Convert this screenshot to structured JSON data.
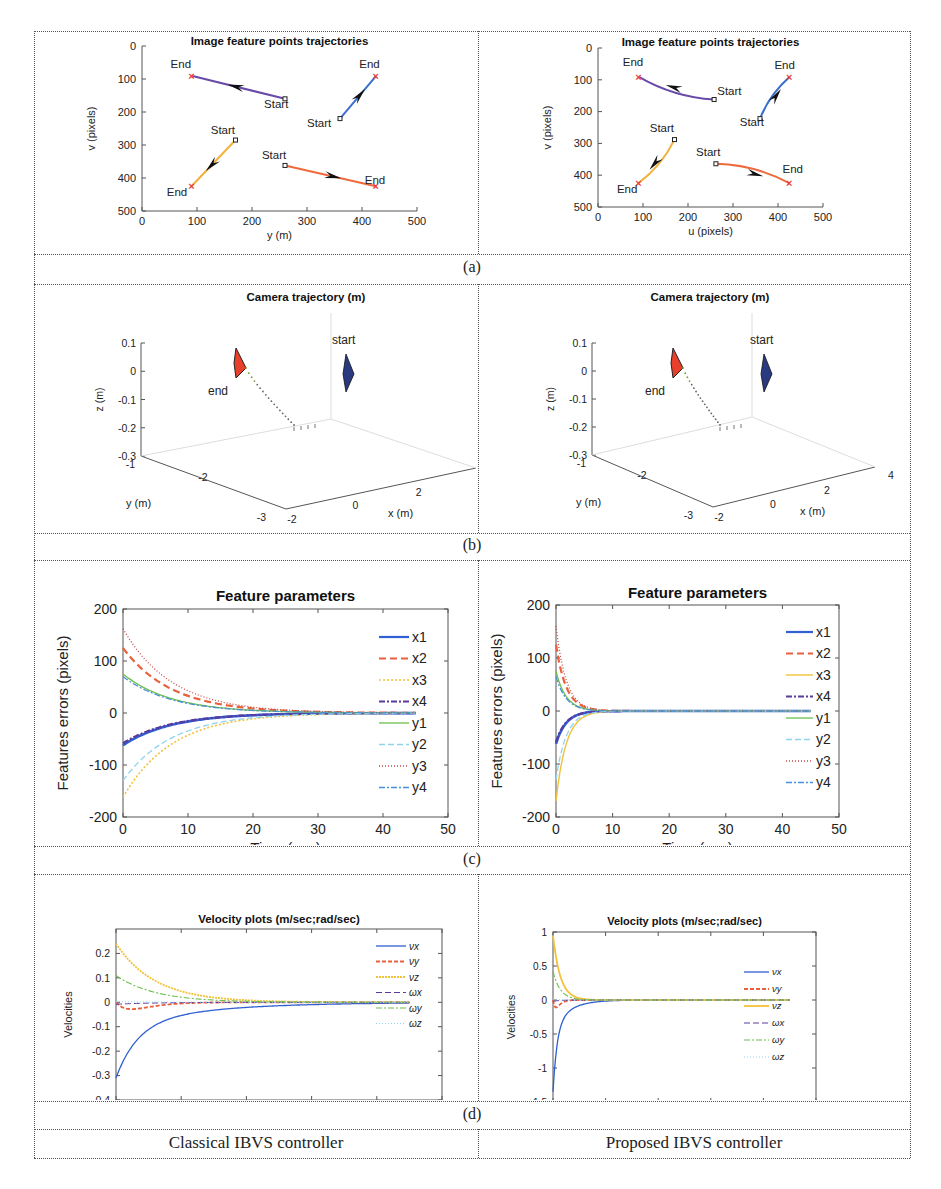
{
  "figure": {
    "rows": [
      {
        "label": "(a)"
      },
      {
        "label": "(b)"
      },
      {
        "label": "(c)"
      },
      {
        "label": "(d)"
      }
    ],
    "footer": {
      "left": "Classical IBVS controller",
      "right": "Proposed IBVS controller"
    }
  },
  "colors": {
    "x1": "#2f5fd0",
    "x2": "#e8603c",
    "x3": "#f2c23a",
    "x4": "#5b3a9e",
    "y1": "#6cc04a",
    "y2": "#8fd3f0",
    "y3": "#c84a4a",
    "y4": "#4a90d9",
    "traj_purple": "#6a4aa8",
    "traj_blue": "#3a6fd0",
    "traj_orange": "#f2b23a",
    "traj_red": "#ee6a3c",
    "end_marker": "#e8403a",
    "cam_end": "#e8402a",
    "cam_start": "#2a3a80"
  },
  "chart_data": [
    {
      "id": "a-left",
      "type": "scatter",
      "title": "Image feature points trajectories",
      "xlabel": "y (m)",
      "ylabel": "v (pixels)",
      "xlim": [
        0,
        500
      ],
      "ylim": [
        500,
        0
      ],
      "xticks": [
        0,
        100,
        200,
        300,
        400,
        500
      ],
      "yticks": [
        0,
        100,
        200,
        300,
        400,
        500
      ],
      "series": [
        {
          "name": "p1",
          "color": "traj_purple",
          "start": [
            260,
            160
          ],
          "end": [
            90,
            90
          ],
          "curve": 0
        },
        {
          "name": "p2",
          "color": "traj_blue",
          "start": [
            360,
            220
          ],
          "end": [
            425,
            92
          ],
          "curve": 0
        },
        {
          "name": "p3",
          "color": "traj_orange",
          "start": [
            170,
            285
          ],
          "end": [
            90,
            425
          ],
          "curve": 0
        },
        {
          "name": "p4",
          "color": "traj_red",
          "start": [
            260,
            362
          ],
          "end": [
            425,
            425
          ],
          "curve": 0
        }
      ],
      "annotations": [
        {
          "text": "End",
          "x": 52,
          "y": 66
        },
        {
          "text": "Start",
          "x": 222,
          "y": 187
        },
        {
          "text": "End",
          "x": 395,
          "y": 66
        },
        {
          "text": "Start",
          "x": 300,
          "y": 246
        },
        {
          "text": "Start",
          "x": 125,
          "y": 268
        },
        {
          "text": "End",
          "x": 45,
          "y": 455
        },
        {
          "text": "Start",
          "x": 218,
          "y": 342
        },
        {
          "text": "End",
          "x": 405,
          "y": 418
        }
      ]
    },
    {
      "id": "a-right",
      "type": "scatter",
      "title": "Image feature points trajectories",
      "xlabel": "u (pixels)",
      "ylabel": "v (pixels)",
      "xlim": [
        0,
        500
      ],
      "ylim": [
        500,
        0
      ],
      "xticks": [
        0,
        100,
        200,
        300,
        400,
        500
      ],
      "yticks": [
        0,
        100,
        200,
        300,
        400,
        500
      ],
      "series": [
        {
          "name": "p1",
          "color": "traj_purple",
          "start": [
            258,
            162
          ],
          "end": [
            90,
            90
          ],
          "curve": 1
        },
        {
          "name": "p2",
          "color": "traj_blue",
          "start": [
            360,
            222
          ],
          "end": [
            425,
            92
          ],
          "curve": 1
        },
        {
          "name": "p3",
          "color": "traj_orange",
          "start": [
            170,
            288
          ],
          "end": [
            90,
            425
          ],
          "curve": 1
        },
        {
          "name": "p4",
          "color": "traj_red",
          "start": [
            262,
            364
          ],
          "end": [
            425,
            425
          ],
          "curve": 1
        }
      ],
      "annotations": [
        {
          "text": "End",
          "x": 55,
          "y": 58
        },
        {
          "text": "Start",
          "x": 265,
          "y": 148
        },
        {
          "text": "End",
          "x": 392,
          "y": 66
        },
        {
          "text": "Start",
          "x": 315,
          "y": 245
        },
        {
          "text": "Start",
          "x": 115,
          "y": 265
        },
        {
          "text": "End",
          "x": 42,
          "y": 455
        },
        {
          "text": "Start",
          "x": 218,
          "y": 340
        },
        {
          "text": "End",
          "x": 410,
          "y": 393
        }
      ]
    },
    {
      "id": "b-left",
      "type": "line3d",
      "title": "Camera trajectory (m)",
      "xlabel": "x (m)",
      "ylabel": "y (m)",
      "zlabel": "z (m)",
      "zticks": [
        0.1,
        0,
        -0.1,
        -0.2,
        -0.3
      ],
      "yticks": [
        -1,
        -2,
        -3
      ],
      "xticks": [
        -2,
        0,
        2,
        4
      ],
      "labels": {
        "start": "start",
        "end": "end"
      }
    },
    {
      "id": "b-right",
      "type": "line3d",
      "title": "Camera trajectory (m)",
      "xlabel": "x (m)",
      "ylabel": "y (m)",
      "zlabel": "z (m)",
      "zticks": [
        0.1,
        0,
        -0.1,
        -0.2,
        -0.3
      ],
      "yticks": [
        -1,
        -2,
        -3
      ],
      "xticks": [
        -2,
        0,
        2,
        4
      ],
      "labels": {
        "start": "start",
        "end": "end"
      }
    },
    {
      "id": "c-left",
      "type": "line",
      "title": "Feature parameters",
      "xlabel": "Time (sec)",
      "ylabel": "Features errors (pixels)",
      "xlim": [
        0,
        50
      ],
      "ylim": [
        -200,
        200
      ],
      "xticks": [
        0,
        10,
        20,
        30,
        40,
        50
      ],
      "yticks": [
        200,
        100,
        0,
        -100,
        -200
      ],
      "t_end": 45,
      "tau": 7.5,
      "series": [
        {
          "name": "x1",
          "y0": -62,
          "color": "x1",
          "dash": "",
          "width": 2.6
        },
        {
          "name": "x2",
          "y0": 125,
          "color": "x2",
          "dash": "7,4",
          "width": 2.2
        },
        {
          "name": "x3",
          "y0": -162,
          "color": "x3",
          "dash": "2,2",
          "width": 1.6
        },
        {
          "name": "x4",
          "y0": -58,
          "color": "x4",
          "dash": "6,2,2,2",
          "width": 2.2
        },
        {
          "name": "y1",
          "y0": 75,
          "color": "y1",
          "dash": "",
          "width": 1.3
        },
        {
          "name": "y2",
          "y0": -130,
          "color": "y2",
          "dash": "6,3",
          "width": 1.3
        },
        {
          "name": "y3",
          "y0": 162,
          "color": "y3",
          "dash": "1,2",
          "width": 1.3
        },
        {
          "name": "y4",
          "y0": 70,
          "color": "y4",
          "dash": "6,2,2,2",
          "width": 1.3
        }
      ],
      "legend": {
        "position": "right-inside"
      }
    },
    {
      "id": "c-right",
      "type": "line",
      "title": "Feature parameters",
      "xlabel": "Time (sec)",
      "ylabel": "Features errors (pixels)",
      "xlim": [
        0,
        50
      ],
      "ylim": [
        -200,
        200
      ],
      "xticks": [
        0,
        10,
        20,
        30,
        40,
        50
      ],
      "yticks": [
        200,
        100,
        0,
        -100,
        -200
      ],
      "t_end": 45,
      "tau": 1.8,
      "series": [
        {
          "name": "x1",
          "y0": -62,
          "color": "x1",
          "dash": "",
          "width": 2.6
        },
        {
          "name": "x2",
          "y0": 125,
          "color": "x2",
          "dash": "7,4",
          "width": 2.2
        },
        {
          "name": "x3",
          "y0": -170,
          "color": "x3",
          "dash": "",
          "width": 1.4
        },
        {
          "name": "x4",
          "y0": -58,
          "color": "x4",
          "dash": "6,2,2,2",
          "width": 2.2
        },
        {
          "name": "y1",
          "y0": 75,
          "color": "y1",
          "dash": "",
          "width": 1.3
        },
        {
          "name": "y2",
          "y0": -130,
          "color": "y2",
          "dash": "6,3",
          "width": 1.3
        },
        {
          "name": "y3",
          "y0": 160,
          "color": "y3",
          "dash": "1,2",
          "width": 1.3
        },
        {
          "name": "y4",
          "y0": 65,
          "color": "y4",
          "dash": "6,2,2,2",
          "width": 1.3
        }
      ],
      "legend": {
        "position": "right-inside"
      }
    },
    {
      "id": "d-left",
      "type": "line",
      "title": "Velocity plots (m/sec;rad/sec)",
      "xlabel": "Time (sec)",
      "ylabel": "Velocities",
      "xlim": [
        0,
        50
      ],
      "ylim": [
        -0.4,
        0.3
      ],
      "xticks": [
        0,
        10,
        20,
        30,
        40,
        50
      ],
      "yticks": [
        0.2,
        0.1,
        0,
        -0.1,
        -0.2,
        -0.3,
        -0.4
      ],
      "t_end": 45,
      "tau": 6,
      "series": [
        {
          "name": "νx",
          "y0": -0.31,
          "color": "x1",
          "dash": "",
          "width": 1.3,
          "shape": "fast"
        },
        {
          "name": "νy",
          "y0": 0,
          "color": "x2",
          "dash": "4,2",
          "width": 1.8,
          "shape": "dip",
          "dip": -0.028
        },
        {
          "name": "νz",
          "y0": 0.24,
          "color": "x3",
          "dash": "2,1",
          "width": 1.8,
          "shape": "exp"
        },
        {
          "name": "ωx",
          "y0": -0.008,
          "color": "x4",
          "dash": "6,3",
          "width": 1,
          "shape": "exp"
        },
        {
          "name": "ωy",
          "y0": 0.11,
          "color": "y1",
          "dash": "6,2,2,2",
          "width": 1.1,
          "shape": "exp"
        },
        {
          "name": "ωz",
          "y0": 0.003,
          "color": "y2",
          "dash": "1,2",
          "width": 1,
          "shape": "exp"
        }
      ],
      "legend": {
        "position": "right-inside"
      }
    },
    {
      "id": "d-right",
      "type": "line",
      "title": "Velocity plots (m/sec;rad/sec)",
      "xlabel": "Time (sec)",
      "ylabel": "Velocities",
      "xlim": [
        0,
        50
      ],
      "ylim": [
        -1.5,
        1
      ],
      "xticks": [
        0,
        10,
        20,
        30,
        40,
        50
      ],
      "yticks": [
        1,
        0.5,
        0,
        -0.5,
        -1,
        -1.5
      ],
      "t_end": 45,
      "tau": 1.4,
      "series": [
        {
          "name": "νx",
          "y0": -1.35,
          "color": "x1",
          "dash": "",
          "width": 1.3,
          "shape": "fast"
        },
        {
          "name": "νy",
          "y0": 0,
          "color": "x2",
          "dash": "4,2",
          "width": 1.8,
          "shape": "dip",
          "dip": -0.11
        },
        {
          "name": "νz",
          "y0": 0.95,
          "color": "x3",
          "dash": "",
          "width": 1.8,
          "shape": "exp"
        },
        {
          "name": "ωx",
          "y0": -0.02,
          "color": "x4",
          "dash": "6,3",
          "width": 1,
          "shape": "exp"
        },
        {
          "name": "ωy",
          "y0": 0.42,
          "color": "y1",
          "dash": "6,2,2,2",
          "width": 1.1,
          "shape": "exp"
        },
        {
          "name": "ωz",
          "y0": 0.01,
          "color": "y2",
          "dash": "1,2",
          "width": 1,
          "shape": "exp"
        }
      ],
      "legend": {
        "position": "right-inside"
      }
    }
  ]
}
